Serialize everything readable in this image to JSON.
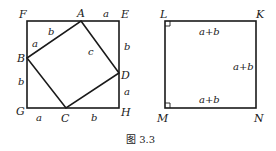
{
  "figure": {
    "caption": "图 3.3",
    "left_square": {
      "outer_vertices": {
        "F": "F",
        "E": "E",
        "G": "G",
        "H": "H"
      },
      "inner_vertices": {
        "A": "A",
        "B": "B",
        "C": "C",
        "D": "D"
      },
      "segment_labels": {
        "AE": "a",
        "ED": "b",
        "DH": "a",
        "HC": "b",
        "CG": "a",
        "GB": "b",
        "BF": "a",
        "FA": "b",
        "inner_side": "c"
      }
    },
    "right_square": {
      "vertices": {
        "L": "L",
        "K": "K",
        "M": "M",
        "N": "N"
      },
      "side_labels": {
        "top": "a+b",
        "right": "a+b",
        "bottom": "a+b"
      }
    }
  }
}
